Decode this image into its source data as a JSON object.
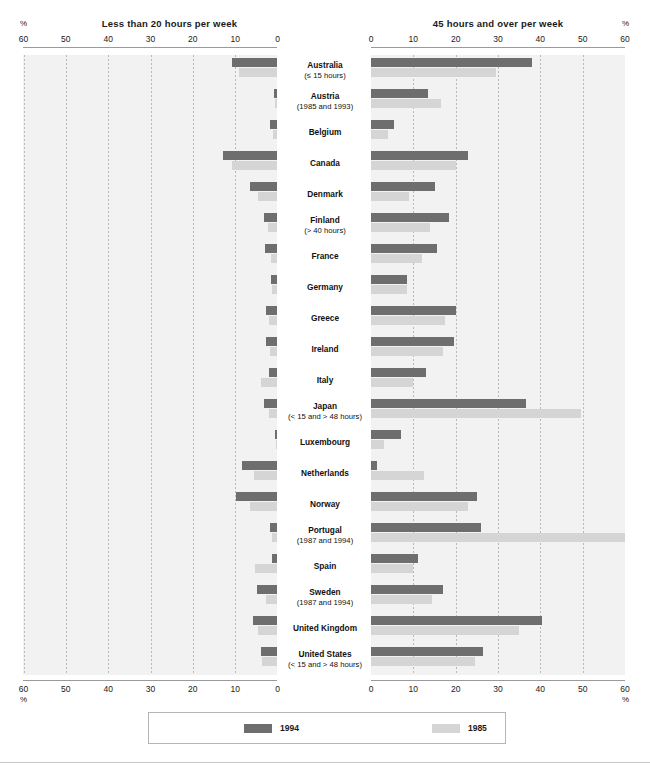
{
  "chart_data": {
    "type": "bar",
    "title": "",
    "orientation": "horizontal-bidirectional",
    "panels": [
      {
        "id": "left",
        "title": "Less than 20 hours per week",
        "pct_symbol": "%",
        "axis_direction": "right-to-left",
        "ticks": [
          60,
          50,
          40,
          30,
          20,
          10,
          0
        ],
        "tick_labels": [
          "60",
          "50",
          "40",
          "30",
          "20",
          "10",
          "0"
        ],
        "xlim": [
          0,
          60
        ],
        "ylabel": "",
        "grid": true
      },
      {
        "id": "right",
        "title": "45 hours and over per week",
        "pct_symbol": "%",
        "axis_direction": "left-to-right",
        "ticks": [
          0,
          10,
          20,
          30,
          40,
          50,
          60
        ],
        "tick_labels": [
          "0",
          "10",
          "20",
          "30",
          "40",
          "50",
          "60"
        ],
        "xlim": [
          0,
          60
        ],
        "ylabel": "",
        "grid": true
      }
    ],
    "series": [
      {
        "name": "1994",
        "color": "#6e6e6e"
      },
      {
        "name": "1985",
        "color": "#d5d5d5"
      }
    ],
    "categories": [
      "Australia",
      "Austria",
      "Belgium",
      "Canada",
      "Denmark",
      "Finland",
      "France",
      "Germany",
      "Greece",
      "Ireland",
      "Italy",
      "Japan",
      "Luxembourg",
      "Netherlands",
      "Norway",
      "Portugal",
      "Spain",
      "Sweden",
      "United Kingdom",
      "United States"
    ],
    "rows": [
      {
        "country": "Australia",
        "note": "(≤ 15 hours)",
        "left": {
          "1994": 10.8,
          "1985": 9.2
        },
        "right": {
          "1994": 38.0,
          "1985": 29.5
        }
      },
      {
        "country": "Austria",
        "note": "(1985 and 1993)",
        "left": {
          "1994": 0.9,
          "1985": 0.5
        },
        "right": {
          "1994": 13.5,
          "1985": 16.5
        }
      },
      {
        "country": "Belgium",
        "note": "",
        "left": {
          "1994": 1.8,
          "1985": 1.0
        },
        "right": {
          "1994": 5.5,
          "1985": 4.0
        }
      },
      {
        "country": "Canada",
        "note": "",
        "left": {
          "1994": 12.8,
          "1985": 10.8
        },
        "right": {
          "1994": 23.0,
          "1985": 20.0
        }
      },
      {
        "country": "Denmark",
        "note": "",
        "left": {
          "1994": 6.5,
          "1985": 4.5
        },
        "right": {
          "1994": 15.0,
          "1985": 9.0
        }
      },
      {
        "country": "Finland",
        "note": "(> 40 hours)",
        "left": {
          "1994": 3.2,
          "1985": 2.2
        },
        "right": {
          "1994": 18.5,
          "1985": 14.0
        }
      },
      {
        "country": "France",
        "note": "",
        "left": {
          "1994": 3.0,
          "1985": 1.6
        },
        "right": {
          "1994": 15.5,
          "1985": 12.0
        }
      },
      {
        "country": "Germany",
        "note": "",
        "left": {
          "1994": 1.6,
          "1985": 1.2
        },
        "right": {
          "1994": 8.5,
          "1985": 8.5
        }
      },
      {
        "country": "Greece",
        "note": "",
        "left": {
          "1994": 2.8,
          "1985": 2.0
        },
        "right": {
          "1994": 20.0,
          "1985": 17.5
        }
      },
      {
        "country": "Ireland",
        "note": "",
        "left": {
          "1994": 2.8,
          "1985": 1.8
        },
        "right": {
          "1994": 19.5,
          "1985": 17.0
        }
      },
      {
        "country": "Italy",
        "note": "",
        "left": {
          "1994": 2.0,
          "1985": 4.0
        },
        "right": {
          "1994": 13.0,
          "1985": 10.0
        }
      },
      {
        "country": "Japan",
        "note": "(< 15 and > 48 hours)",
        "left": {
          "1994": 3.2,
          "1985": 2.0
        },
        "right": {
          "1994": 36.5,
          "1985": 49.5
        }
      },
      {
        "country": "Luxembourg",
        "note": "",
        "left": {
          "1994": 0.6,
          "1985": 0.4
        },
        "right": {
          "1994": 7.0,
          "1985": 3.0
        }
      },
      {
        "country": "Netherlands",
        "note": "",
        "left": {
          "1994": 8.5,
          "1985": 5.5
        },
        "right": {
          "1994": 1.5,
          "1985": 12.5
        }
      },
      {
        "country": "Norway",
        "note": "",
        "left": {
          "1994": 9.8,
          "1985": 6.5
        },
        "right": {
          "1994": 25.0,
          "1985": 23.0
        }
      },
      {
        "country": "Portugal",
        "note": "(1987 and 1994)",
        "left": {
          "1994": 1.8,
          "1985": 1.2
        },
        "right": {
          "1994": 26.0,
          "1985": 60.0
        }
      },
      {
        "country": "Spain",
        "note": "",
        "left": {
          "1994": 1.2,
          "1985": 5.2
        },
        "right": {
          "1994": 11.0,
          "1985": 10.0
        }
      },
      {
        "country": "Sweden",
        "note": "(1987 and 1994)",
        "left": {
          "1994": 4.8,
          "1985": 2.8
        },
        "right": {
          "1994": 17.0,
          "1985": 14.5
        }
      },
      {
        "country": "United Kingdom",
        "note": "",
        "left": {
          "1994": 5.8,
          "1985": 4.6
        },
        "right": {
          "1994": 40.5,
          "1985": 35.0
        }
      },
      {
        "country": "United States",
        "note": "(< 15 and > 48 hours)",
        "left": {
          "1994": 4.0,
          "1985": 3.6
        },
        "right": {
          "1994": 26.5,
          "1985": 24.5
        }
      }
    ],
    "legend": {
      "position": "bottom-center",
      "entries": [
        {
          "label": "1994",
          "color": "#6e6e6e"
        },
        {
          "label": "1985",
          "color": "#d5d5d5"
        }
      ]
    },
    "colors": {
      "series_1994": "#6e6e6e",
      "series_1985": "#d5d5d5",
      "plot_background": "#f2f2f2",
      "gridline": "#b9b9b9",
      "axis": "#9a9a9a"
    }
  }
}
